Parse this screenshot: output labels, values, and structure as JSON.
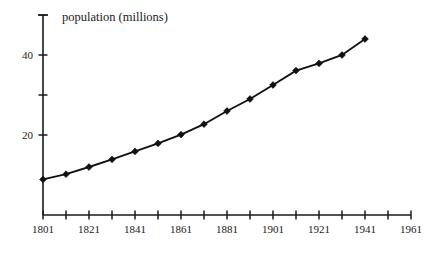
{
  "chart_data": {
    "type": "line",
    "title": "population (millions)",
    "xlabel": "",
    "ylabel": "population (millions)",
    "xlim": [
      1801,
      1961
    ],
    "ylim": [
      0,
      50
    ],
    "grid": false,
    "legend": null,
    "x_tick_values": [
      1801,
      1811,
      1821,
      1831,
      1841,
      1851,
      1861,
      1871,
      1881,
      1891,
      1901,
      1911,
      1921,
      1931,
      1941,
      1951,
      1961
    ],
    "x_tick_labels": [
      "1801",
      "",
      "1821",
      "",
      "1841",
      "",
      "1861",
      "",
      "1881",
      "",
      "1901",
      "",
      "1921",
      "",
      "1941",
      "",
      "1961"
    ],
    "y_tick_values": [
      20,
      30,
      40,
      50
    ],
    "y_tick_labels": [
      "20",
      "",
      "40",
      ""
    ],
    "marker": "diamond",
    "x": [
      1801,
      1811,
      1821,
      1831,
      1841,
      1851,
      1861,
      1871,
      1881,
      1891,
      1901,
      1911,
      1921,
      1931,
      1941
    ],
    "values": [
      8.9,
      10.2,
      12.0,
      13.9,
      15.9,
      17.9,
      20.1,
      22.7,
      26.0,
      29.0,
      32.5,
      36.1,
      37.9,
      40.0,
      44.0
    ],
    "series": [
      {
        "name": "population",
        "values": [
          8.9,
          10.2,
          12.0,
          13.9,
          15.9,
          17.9,
          20.1,
          22.7,
          26.0,
          29.0,
          32.5,
          36.1,
          37.9,
          40.0,
          44.0
        ]
      }
    ]
  },
  "colors": {
    "ink": "#1a1a1a",
    "series": "#111111",
    "background": "#ffffff"
  }
}
